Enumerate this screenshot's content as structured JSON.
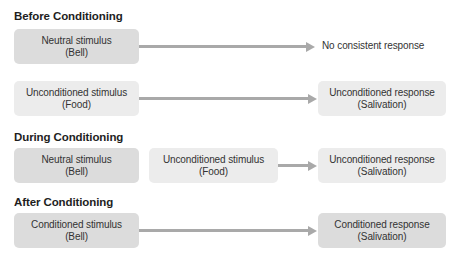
{
  "sections": [
    {
      "heading": "Before Conditioning",
      "rows": [
        {
          "inputs": [
            {
              "line1": "Neutral stimulus",
              "line2": "(Bell)",
              "shade": "dark"
            }
          ],
          "output": {
            "text": "No consistent response",
            "boxed": false
          }
        },
        {
          "inputs": [
            {
              "line1": "Unconditioned stimulus",
              "line2": "(Food)",
              "shade": "light"
            }
          ],
          "output": {
            "line1": "Unconditioned response",
            "line2": "(Salivation)",
            "shade": "light",
            "boxed": true
          }
        }
      ]
    },
    {
      "heading": "During Conditioning",
      "rows": [
        {
          "inputs": [
            {
              "line1": "Neutral stimulus",
              "line2": "(Bell)",
              "shade": "dark"
            },
            {
              "line1": "Unconditioned stimulus",
              "line2": "(Food)",
              "shade": "light"
            }
          ],
          "output": {
            "line1": "Unconditioned response",
            "line2": "(Salivation)",
            "shade": "light",
            "boxed": true
          }
        }
      ]
    },
    {
      "heading": "After Conditioning",
      "rows": [
        {
          "inputs": [
            {
              "line1": "Conditioned stimulus",
              "line2": "(Bell)",
              "shade": "dark"
            }
          ],
          "output": {
            "line1": "Conditioned response",
            "line2": "(Salivation)",
            "shade": "dark",
            "boxed": true
          }
        }
      ]
    }
  ],
  "colors": {
    "dark_box": "#dcdcdc",
    "light_box": "#ececec",
    "arrow": "#a9a9a9",
    "heading": "#1e1e1e"
  }
}
